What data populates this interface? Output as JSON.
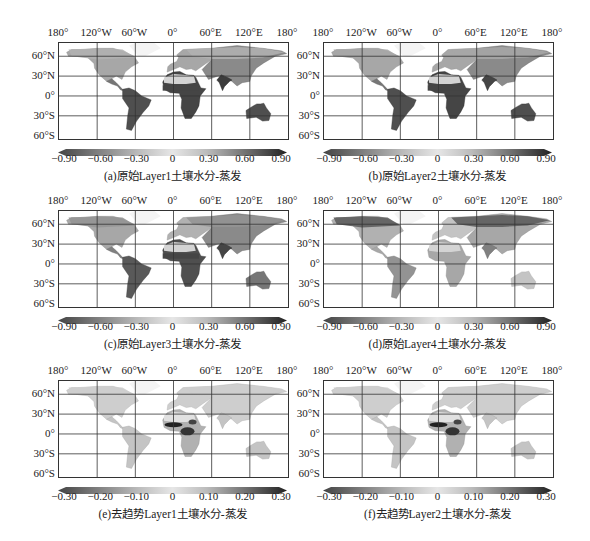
{
  "chart_data": [
    {
      "type": "heatmap",
      "panel": "a",
      "title": "(a)原始Layer1土壤水分-蒸发",
      "lon_ticks": [
        "180°",
        "120°W",
        "60°W",
        "0°",
        "60°E",
        "120°E",
        "180°"
      ],
      "lat_ticks": [
        "60°N",
        "30°N",
        "0°",
        "30°S",
        "60°S"
      ],
      "colorbar_ticks": [
        "−0.90",
        "−0.60",
        "−0.30",
        "0",
        "0.30",
        "0.60",
        "0.90"
      ],
      "colorbar_range": [
        -0.9,
        0.9
      ],
      "note": "Strong positive correlation (dark) over Sahel, southern Africa, India, Australia, eastern South America"
    },
    {
      "type": "heatmap",
      "panel": "b",
      "title": "(b)原始Layer2土壤水分-蒸发",
      "lon_ticks": [
        "180°",
        "120°W",
        "60°W",
        "0°",
        "60°E",
        "120°E",
        "180°"
      ],
      "lat_ticks": [
        "60°N",
        "30°N",
        "0°",
        "30°S",
        "60°S"
      ],
      "colorbar_ticks": [
        "−0.90",
        "−0.60",
        "−0.30",
        "0",
        "0.30",
        "0.60",
        "0.90"
      ],
      "colorbar_range": [
        -0.9,
        0.9
      ]
    },
    {
      "type": "heatmap",
      "panel": "c",
      "title": "(c)原始Layer3土壤水分-蒸发",
      "lon_ticks": [
        "180°",
        "120°W",
        "60°W",
        "0°",
        "60°E",
        "120°E",
        "180°"
      ],
      "lat_ticks": [
        "60°N",
        "30°N",
        "0°",
        "30°S",
        "60°S"
      ],
      "colorbar_ticks": [
        "−0.90",
        "−0.60",
        "−0.30",
        "0",
        "0.30",
        "0.60",
        "0.90"
      ],
      "colorbar_range": [
        -0.9,
        0.9
      ]
    },
    {
      "type": "heatmap",
      "panel": "d",
      "title": "(d)原始Layer4土壤水分-蒸发",
      "lon_ticks": [
        "180°",
        "120°W",
        "60°W",
        "0°",
        "60°E",
        "120°E",
        "180°"
      ],
      "lat_ticks": [
        "60°N",
        "30°N",
        "0°",
        "30°S",
        "60°S"
      ],
      "colorbar_ticks": [
        "−0.90",
        "−0.60",
        "−0.30",
        "0",
        "0.30",
        "0.60",
        "0.90"
      ],
      "colorbar_range": [
        -0.9,
        0.9
      ],
      "note": "Dark values concentrated in high northern latitudes (boreal band)"
    },
    {
      "type": "heatmap",
      "panel": "e",
      "title": "(e)去趋势Layer1土壤水分-蒸发",
      "lon_ticks": [
        "180°",
        "120°W",
        "60°W",
        "0°",
        "60°E",
        "120°E",
        "180°"
      ],
      "lat_ticks": [
        "60°N",
        "30°N",
        "0°",
        "30°S",
        "60°S"
      ],
      "colorbar_ticks": [
        "−0.30",
        "−0.20",
        "−0.10",
        "0",
        "0.10",
        "0.20",
        "0.30"
      ],
      "colorbar_range": [
        -0.3,
        0.3
      ],
      "note": "Mostly near zero; strong values over central/west Africa"
    },
    {
      "type": "heatmap",
      "panel": "f",
      "title": "(f)去趋势Layer2土壤水分-蒸发",
      "lon_ticks": [
        "180°",
        "120°W",
        "60°W",
        "0°",
        "60°E",
        "120°E",
        "180°"
      ],
      "lat_ticks": [
        "60°N",
        "30°N",
        "0°",
        "30°S",
        "60°S"
      ],
      "colorbar_ticks": [
        "−0.30",
        "−0.20",
        "−0.10",
        "0",
        "0.10",
        "0.20",
        "0.30"
      ],
      "colorbar_range": [
        -0.3,
        0.3
      ]
    }
  ],
  "panels": [
    {
      "caption": "(a)原始Layer1土壤水分-蒸发",
      "ticks": [
        "−0.90",
        "−0.60",
        "−0.30",
        "0",
        "0.30",
        "0.60",
        "0.90"
      ]
    },
    {
      "caption": "(b)原始Layer2土壤水分-蒸发",
      "ticks": [
        "−0.90",
        "−0.60",
        "−0.30",
        "0",
        "0.30",
        "0.60",
        "0.90"
      ]
    },
    {
      "caption": "(c)原始Layer3土壤水分-蒸发",
      "ticks": [
        "−0.90",
        "−0.60",
        "−0.30",
        "0",
        "0.30",
        "0.60",
        "0.90"
      ]
    },
    {
      "caption": "(d)原始Layer4土壤水分-蒸发",
      "ticks": [
        "−0.90",
        "−0.60",
        "−0.30",
        "0",
        "0.30",
        "0.60",
        "0.90"
      ]
    },
    {
      "caption": "(e)去趋势Layer1土壤水分-蒸发",
      "ticks": [
        "−0.30",
        "−0.20",
        "−0.10",
        "0",
        "0.10",
        "0.20",
        "0.30"
      ]
    },
    {
      "caption": "(f)去趋势Layer2土壤水分-蒸发",
      "ticks": [
        "−0.30",
        "−0.20",
        "−0.10",
        "0",
        "0.10",
        "0.20",
        "0.30"
      ]
    }
  ],
  "lon_labels": [
    "180°",
    "120°W",
    "60°W",
    "0°",
    "60°E",
    "120°E",
    "180°"
  ],
  "lat_labels": [
    "60°N",
    "30°N",
    "0°",
    "30°S",
    "60°S"
  ]
}
